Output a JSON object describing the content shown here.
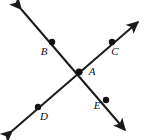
{
  "figure": {
    "type": "geometry-diagram",
    "background_color": "#ffffff",
    "stroke_color": "#1a1a1a",
    "point_color": "#111111",
    "label_color": "#111111",
    "stroke_width": 2,
    "canvas": {
      "width": 150,
      "height": 140
    },
    "lines": [
      {
        "name": "line-b-a-e",
        "from": {
          "x": 21,
          "y": 9
        },
        "to": {
          "x": 125,
          "y": 130
        },
        "arrow_start": true,
        "arrow_end": true,
        "passes_through": [
          "B",
          "A",
          "E"
        ]
      },
      {
        "name": "line-d-a-c",
        "from": {
          "x": 12,
          "y": 131
        },
        "to": {
          "x": 138,
          "y": 22
        },
        "arrow_start": true,
        "arrow_end": true,
        "passes_through": [
          "D",
          "A",
          "C"
        ]
      }
    ],
    "points": [
      {
        "id": "B",
        "label": "B",
        "x": 52,
        "y": 42,
        "radius": 3.2,
        "label_x": 44,
        "label_y": 52
      },
      {
        "id": "C",
        "label": "C",
        "x": 112,
        "y": 42,
        "radius": 3.2,
        "label_x": 115,
        "label_y": 52
      },
      {
        "id": "A",
        "label": "A",
        "x": 79,
        "y": 72,
        "radius": 3.6,
        "label_x": 92,
        "label_y": 72
      },
      {
        "id": "D",
        "label": "D",
        "x": 38,
        "y": 107,
        "radius": 3.2,
        "label_x": 44,
        "label_y": 117
      },
      {
        "id": "E",
        "label": "E",
        "x": 106,
        "y": 100,
        "radius": 3.2,
        "label_x": 97,
        "label_y": 106
      }
    ]
  }
}
